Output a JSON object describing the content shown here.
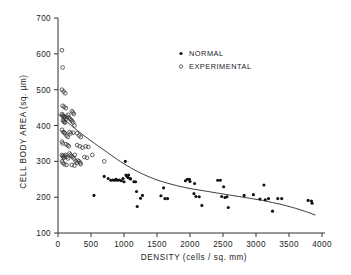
{
  "chart_data": {
    "type": "scatter",
    "title": "",
    "xlabel": "DENSITY (cells / sq.  mm)",
    "ylabel": "CELL BODY AREA (sq. µm)",
    "xlim": [
      0,
      4000
    ],
    "ylim": [
      100,
      700
    ],
    "xticks": [
      0,
      500,
      1000,
      1500,
      2000,
      2500,
      3000,
      3500,
      4000
    ],
    "xticklabels": [
      "0",
      "500",
      "1000",
      "1500",
      "2000",
      "2500",
      "3000",
      "3500",
      "4000"
    ],
    "yticks": [
      100,
      200,
      300,
      400,
      500,
      600,
      700
    ],
    "yticklabels": [
      "100",
      "200",
      "300",
      "400",
      "500",
      "600",
      "700"
    ],
    "grid": false,
    "legend_position": "top-center",
    "legend": [
      {
        "label": "NORMAL",
        "marker": "filled-circle"
      },
      {
        "label": "EXPERIMENTAL",
        "marker": "open-circle"
      }
    ],
    "series": [
      {
        "name": "NORMAL",
        "marker": "filled-circle",
        "points": [
          [
            545,
            205
          ],
          [
            700,
            258
          ],
          [
            760,
            252
          ],
          [
            800,
            247
          ],
          [
            830,
            248
          ],
          [
            860,
            247
          ],
          [
            880,
            250
          ],
          [
            900,
            247
          ],
          [
            930,
            248
          ],
          [
            960,
            246
          ],
          [
            985,
            252
          ],
          [
            1000,
            243
          ],
          [
            1020,
            300
          ],
          [
            1030,
            262
          ],
          [
            1045,
            258
          ],
          [
            1060,
            255
          ],
          [
            1070,
            262
          ],
          [
            1090,
            252
          ],
          [
            1100,
            251
          ],
          [
            1150,
            243
          ],
          [
            1175,
            243
          ],
          [
            1190,
            216
          ],
          [
            1200,
            174
          ],
          [
            1250,
            197
          ],
          [
            1280,
            205
          ],
          [
            1560,
            204
          ],
          [
            1600,
            226
          ],
          [
            1620,
            196
          ],
          [
            1660,
            196
          ],
          [
            1930,
            246
          ],
          [
            1960,
            250
          ],
          [
            1990,
            250
          ],
          [
            2000,
            244
          ],
          [
            2060,
            210
          ],
          [
            2070,
            238
          ],
          [
            2090,
            202
          ],
          [
            2140,
            201
          ],
          [
            2180,
            177
          ],
          [
            2420,
            247
          ],
          [
            2460,
            247
          ],
          [
            2480,
            202
          ],
          [
            2510,
            229
          ],
          [
            2530,
            199
          ],
          [
            2560,
            201
          ],
          [
            2580,
            171
          ],
          [
            2820,
            205
          ],
          [
            2960,
            207
          ],
          [
            3060,
            195
          ],
          [
            3120,
            234
          ],
          [
            3140,
            193
          ],
          [
            3190,
            196
          ],
          [
            3250,
            161
          ],
          [
            3330,
            196
          ],
          [
            3390,
            196
          ],
          [
            3790,
            191
          ],
          [
            3840,
            189
          ],
          [
            3850,
            183
          ]
        ]
      },
      {
        "name": "EXPERIMENTAL",
        "marker": "open-circle",
        "points": [
          [
            60,
            610
          ],
          [
            70,
            562
          ],
          [
            60,
            500
          ],
          [
            85,
            495
          ],
          [
            110,
            490
          ],
          [
            70,
            455
          ],
          [
            95,
            452
          ],
          [
            120,
            448
          ],
          [
            60,
            432
          ],
          [
            70,
            428
          ],
          [
            80,
            428
          ],
          [
            90,
            425
          ],
          [
            100,
            424
          ],
          [
            110,
            422
          ],
          [
            75,
            415
          ],
          [
            85,
            412
          ],
          [
            95,
            410
          ],
          [
            105,
            408
          ],
          [
            120,
            418
          ],
          [
            140,
            425
          ],
          [
            155,
            430
          ],
          [
            165,
            422
          ],
          [
            185,
            418
          ],
          [
            200,
            415
          ],
          [
            215,
            412
          ],
          [
            230,
            408
          ],
          [
            250,
            400
          ],
          [
            210,
            440
          ],
          [
            225,
            436
          ],
          [
            240,
            432
          ],
          [
            60,
            388
          ],
          [
            80,
            382
          ],
          [
            95,
            380
          ],
          [
            105,
            378
          ],
          [
            130,
            372
          ],
          [
            150,
            368
          ],
          [
            175,
            382
          ],
          [
            195,
            378
          ],
          [
            230,
            380
          ],
          [
            290,
            378
          ],
          [
            320,
            372
          ],
          [
            345,
            368
          ],
          [
            290,
            345
          ],
          [
            330,
            342
          ],
          [
            370,
            338
          ],
          [
            420,
            342
          ],
          [
            460,
            340
          ],
          [
            60,
            355
          ],
          [
            70,
            350
          ],
          [
            120,
            348
          ],
          [
            145,
            345
          ],
          [
            165,
            342
          ],
          [
            60,
            318
          ],
          [
            70,
            315
          ],
          [
            80,
            312
          ],
          [
            90,
            310
          ],
          [
            100,
            315
          ],
          [
            115,
            318
          ],
          [
            130,
            312
          ],
          [
            150,
            308
          ],
          [
            175,
            322
          ],
          [
            190,
            318
          ],
          [
            205,
            315
          ],
          [
            225,
            312
          ],
          [
            240,
            308
          ],
          [
            255,
            318
          ],
          [
            270,
            300
          ],
          [
            285,
            296
          ],
          [
            300,
            302
          ],
          [
            320,
            300
          ],
          [
            60,
            300
          ],
          [
            75,
            296
          ],
          [
            95,
            292
          ],
          [
            130,
            290
          ],
          [
            210,
            290
          ],
          [
            250,
            288
          ],
          [
            335,
            296
          ],
          [
            345,
            292
          ],
          [
            400,
            312
          ],
          [
            440,
            310
          ],
          [
            520,
            318
          ],
          [
            700,
            300
          ]
        ]
      }
    ],
    "fit_curve": {
      "name": "fitted-trend-curve",
      "points": [
        [
          0,
          432
        ],
        [
          100,
          416
        ],
        [
          200,
          400
        ],
        [
          300,
          385
        ],
        [
          400,
          371
        ],
        [
          500,
          357
        ],
        [
          600,
          344
        ],
        [
          700,
          331
        ],
        [
          800,
          318
        ],
        [
          900,
          305
        ],
        [
          1000,
          293
        ],
        [
          1100,
          282
        ],
        [
          1200,
          272
        ],
        [
          1300,
          263
        ],
        [
          1400,
          255
        ],
        [
          1500,
          248
        ],
        [
          1600,
          242
        ],
        [
          1700,
          237
        ],
        [
          1800,
          232
        ],
        [
          1900,
          228
        ],
        [
          2000,
          224
        ],
        [
          2100,
          221
        ],
        [
          2200,
          218
        ],
        [
          2300,
          215
        ],
        [
          2400,
          212
        ],
        [
          2500,
          209
        ],
        [
          2600,
          206
        ],
        [
          2700,
          203
        ],
        [
          2800,
          200
        ],
        [
          2900,
          197
        ],
        [
          3000,
          194
        ],
        [
          3100,
          191
        ],
        [
          3200,
          187
        ],
        [
          3300,
          183
        ],
        [
          3400,
          179
        ],
        [
          3500,
          174
        ],
        [
          3600,
          169
        ],
        [
          3700,
          163
        ],
        [
          3800,
          157
        ],
        [
          3900,
          150
        ]
      ]
    },
    "colors": {
      "normal_marker": "#111111",
      "experimental_marker": "#333333",
      "curve": "#3a3a3a",
      "axis": "#333333",
      "background": "#ffffff"
    }
  }
}
